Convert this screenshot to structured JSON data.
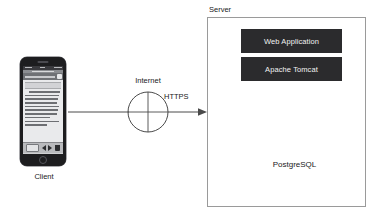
{
  "diagram": {
    "client": {
      "label": "Client",
      "device": "smartphone-mockup"
    },
    "network": {
      "label": "Internet",
      "symbol": "circle-with-cross",
      "protocol_label": "HTTPS",
      "arrow_direction": "client-to-server"
    },
    "server": {
      "label": "Server",
      "components": [
        {
          "label": "Web Application",
          "style": "dark-box"
        },
        {
          "label": "Apache Tomcat",
          "style": "dark-box"
        }
      ],
      "database": {
        "label": "PostgreSQL",
        "shape": "cylinder"
      },
      "connector": {
        "name": "bidirectional-arrow",
        "direction": "both"
      }
    }
  },
  "colors": {
    "box_dark": "#2b2b2d",
    "box_text": "#f2f2f2",
    "border": "#9a9a9a",
    "arrow_gray": "#9d9d9d",
    "cylinder_fill": "#c8c9cb",
    "background": "#ffffff",
    "line": "#4a4a4a"
  }
}
